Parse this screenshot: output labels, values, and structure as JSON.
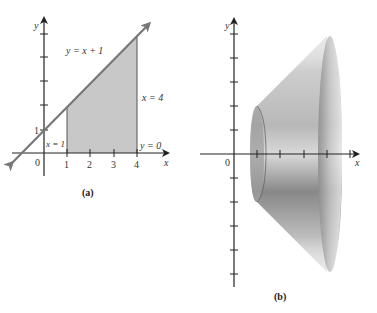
{
  "figure_a": {
    "caption": "(a)",
    "axis_x_label": "x",
    "axis_y_label": "y",
    "origin_label": "0",
    "x_tick_labels": [
      "1",
      "2",
      "3",
      "4"
    ],
    "y_tick_labels": [
      "1"
    ],
    "line_label": "y = x + 1",
    "boundary_labels": {
      "left": "x = 1",
      "right": "x = 4",
      "bottom": "y = 0"
    },
    "colors": {
      "region_fill": "#c8c8c8",
      "line": "#777777",
      "axis": "#222222"
    }
  },
  "figure_b": {
    "caption": "(b)",
    "axis_x_label": "x",
    "axis_y_label": "y",
    "origin_label": "0",
    "description": "Solid of revolution (frustum of a cone) obtained by rotating region (a) about the x-axis",
    "colors": {
      "solid_dark": "#6e6e6e",
      "solid_light": "#e6e6e6",
      "axis": "#222222"
    }
  }
}
